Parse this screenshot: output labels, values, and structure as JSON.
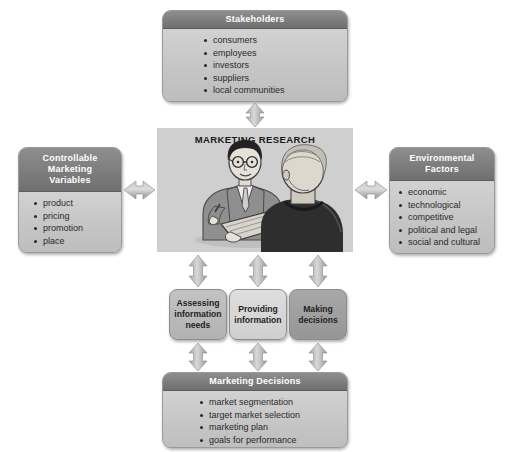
{
  "diagram": {
    "center": {
      "title": "MARKETING RESEARCH",
      "illustration_name": "interviewer-and-respondent-illustration",
      "background_color": "#cfcfcf"
    },
    "panels": {
      "stakeholders": {
        "header": "Stakeholders",
        "items": [
          "consumers",
          "employees",
          "investors",
          "suppliers",
          "local communities"
        ]
      },
      "controllable": {
        "header": "Controllable Marketing Variables",
        "header_lines": [
          "Controllable",
          "Marketing",
          "Variables"
        ],
        "items": [
          "product",
          "pricing",
          "promotion",
          "place"
        ]
      },
      "environmental": {
        "header": "Environmental Factors",
        "header_lines": [
          "Environmental",
          "Factors"
        ],
        "items": [
          "economic",
          "technological",
          "competitive",
          "political and legal",
          "social and cultural"
        ]
      },
      "decisions": {
        "header": "Marketing Decisions",
        "items": [
          "market segmentation",
          "target market selection",
          "marketing plan",
          "goals for performance"
        ]
      }
    },
    "process_boxes": [
      {
        "id": "assessing",
        "lines": [
          "Assessing",
          "information",
          "needs"
        ],
        "shade": "#b2b2b2"
      },
      {
        "id": "providing",
        "lines": [
          "Providing",
          "information"
        ],
        "shade": "#cfcfcf"
      },
      {
        "id": "decisions",
        "lines": [
          "Making",
          "decisions"
        ],
        "shade": "#969696"
      }
    ],
    "arrows": [
      {
        "name": "arrow-center-stakeholders",
        "direction": "vertical-double"
      },
      {
        "name": "arrow-center-controllable",
        "direction": "horizontal-double"
      },
      {
        "name": "arrow-center-environmental",
        "direction": "horizontal-double"
      },
      {
        "name": "arrow-center-assessing",
        "direction": "vertical-double"
      },
      {
        "name": "arrow-center-providing",
        "direction": "vertical-double"
      },
      {
        "name": "arrow-center-decisions",
        "direction": "vertical-double"
      },
      {
        "name": "arrow-assessing-marketing-decisions",
        "direction": "vertical-double"
      },
      {
        "name": "arrow-providing-marketing-decisions",
        "direction": "vertical-double"
      },
      {
        "name": "arrow-decisions-marketing-decisions",
        "direction": "vertical-double"
      }
    ],
    "colors": {
      "header_gray": "#7d7d7d",
      "body_gray": "#c4c4c4",
      "arrow_gray": "#b5b5b5",
      "text_dark": "#2a2a2a",
      "header_text": "#ffffff"
    }
  }
}
